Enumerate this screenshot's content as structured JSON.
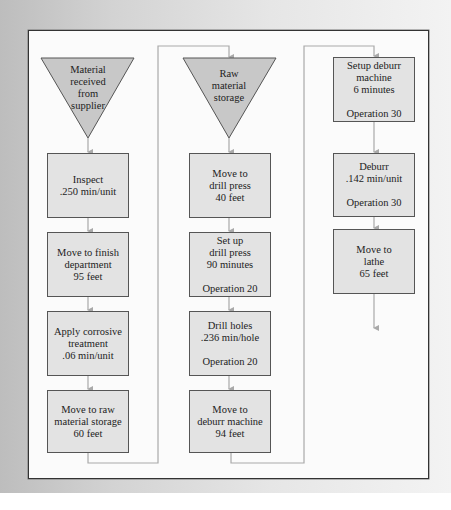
{
  "diagram": {
    "type": "process flow chart",
    "colors": {
      "box_fill": "#e3e3e3",
      "triangle_fill": "#c8c8c8",
      "connector": "#a9a9a9",
      "border": "#555555"
    },
    "columns": [
      {
        "storage": {
          "lines": [
            "Material",
            "received",
            "from",
            "supplier"
          ]
        },
        "steps": [
          {
            "lines": [
              "Inspect",
              ".250 min/unit"
            ]
          },
          {
            "lines": [
              "Move to finish",
              "department",
              "95 feet"
            ]
          },
          {
            "lines": [
              "Apply corrosive",
              "treatment",
              ".06 min/unit"
            ]
          },
          {
            "lines": [
              "Move to raw",
              "material storage",
              "60 feet"
            ]
          }
        ]
      },
      {
        "storage": {
          "lines": [
            "Raw",
            "material",
            "storage"
          ]
        },
        "steps": [
          {
            "lines": [
              "Move to",
              "drill press",
              "40 feet"
            ]
          },
          {
            "lines": [
              "Set up",
              "drill press",
              "90 minutes"
            ],
            "operation": "Operation 20"
          },
          {
            "lines": [
              "Drill holes",
              ".236 min/hole"
            ],
            "operation": "Operation 20"
          },
          {
            "lines": [
              "Move to",
              "deburr machine",
              "94 feet"
            ]
          }
        ]
      },
      {
        "steps": [
          {
            "lines": [
              "Setup deburr",
              "machine",
              "6 minutes"
            ],
            "operation": "Operation 30"
          },
          {
            "lines": [
              "Deburr",
              ".142 min/unit"
            ],
            "operation": "Operation 30"
          },
          {
            "lines": [
              "Move to",
              "lathe",
              "65 feet"
            ]
          }
        ]
      }
    ]
  }
}
